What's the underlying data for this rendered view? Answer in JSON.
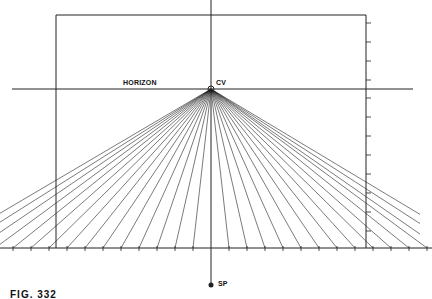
{
  "figure": {
    "caption": "FIG. 332",
    "labels": {
      "horizon": "HORIZON",
      "center_of_vision": "CV",
      "station_point": "SP"
    },
    "colors": {
      "line": "#222222",
      "background": "#ffffff"
    },
    "geometry": {
      "picture_plane": {
        "left": 56,
        "top": 15,
        "right": 366,
        "bottom": 248
      },
      "horizon_y": 89,
      "horizon_x_range": [
        12,
        413
      ],
      "cv": [
        211,
        89
      ],
      "ground_line_y": 248,
      "sp": [
        211,
        285
      ],
      "center_line_top": 0,
      "ground_ticks_x": [
        13,
        31,
        49,
        67,
        85,
        103,
        121,
        139,
        157,
        175,
        193,
        229,
        247,
        265,
        283,
        301,
        319,
        337,
        355,
        373,
        391,
        409,
        427
      ],
      "right_edge_ticks_y": [
        23,
        42,
        61,
        80,
        98,
        117,
        136,
        155,
        174,
        193,
        212,
        231
      ]
    }
  }
}
